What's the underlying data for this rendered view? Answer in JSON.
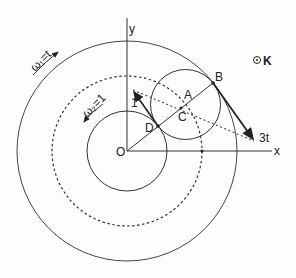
{
  "diagram": {
    "type": "geometry",
    "colors": {
      "line": "#333333",
      "background": "#fdfdfd"
    },
    "axes": {
      "x_label": "x",
      "y_label": "y",
      "origin_label": "O"
    },
    "points": {
      "O": "O",
      "A": "A",
      "B": "B",
      "C": "C",
      "D": "D"
    },
    "frame_label": "K",
    "frame_symbol": "⊙",
    "angular_velocities": {
      "outer": "ω₁=t",
      "inner": "ω₂=1"
    },
    "vectors": {
      "at_D": "1",
      "at_B": "3t"
    },
    "circles": [
      {
        "name": "outer",
        "style": "solid"
      },
      {
        "name": "middle",
        "style": "dashed"
      },
      {
        "name": "inner",
        "style": "solid"
      },
      {
        "name": "rolling",
        "style": "solid",
        "center": "A"
      }
    ]
  }
}
